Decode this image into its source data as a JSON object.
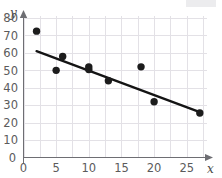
{
  "chart_data": {
    "type": "scatter",
    "title": "",
    "xlabel": "x",
    "ylabel": "y",
    "xlim": [
      0,
      29
    ],
    "ylim": [
      0,
      85
    ],
    "grid": true,
    "legend": "none",
    "x_ticks": [
      0,
      5,
      10,
      15,
      20,
      25
    ],
    "y_ticks": [
      10,
      20,
      30,
      40,
      50,
      60,
      70,
      80
    ],
    "x_tick_labels": [
      "0",
      "5",
      "10",
      "15",
      "20",
      "25"
    ],
    "y_tick_labels": [
      "10",
      "20",
      "30",
      "40",
      "50",
      "60",
      "70",
      "80"
    ],
    "points": [
      {
        "x": 2,
        "y": 72.5
      },
      {
        "x": 5,
        "y": 50
      },
      {
        "x": 6,
        "y": 58
      },
      {
        "x": 10,
        "y": 52
      },
      {
        "x": 10,
        "y": 50.5
      },
      {
        "x": 13,
        "y": 44
      },
      {
        "x": 18,
        "y": 52
      },
      {
        "x": 20,
        "y": 32
      },
      {
        "x": 27,
        "y": 25.5
      }
    ],
    "trend_line": {
      "name": "line of best fit",
      "x_start": 2,
      "y_start": 61,
      "x_end": 27,
      "y_end": 26
    },
    "colors": {
      "point": "#1c1c1c",
      "trend": "#141414",
      "grid": "#e3e1e6",
      "axis": "#6e6e73",
      "tick_text": "#5b5b5b",
      "background": "#ffffff"
    }
  }
}
